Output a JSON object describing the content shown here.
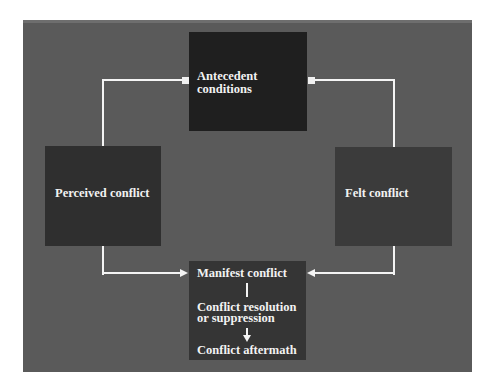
{
  "diagram": {
    "type": "conflict-process-cycle",
    "colors": {
      "panel": "#5a5a5a",
      "antecedent_box": "#1f1f1f",
      "perceived_box": "#2f2f2f",
      "felt_box": "#3b3b3b",
      "manifest_box": "#353535",
      "connector": "#f4f4f4",
      "text": "#f2f2f2"
    },
    "nodes": {
      "antecedent": {
        "line1": "Antecedent",
        "line2": "conditions"
      },
      "perceived": {
        "label": "Perceived conflict"
      },
      "felt": {
        "label": "Felt conflict"
      },
      "manifest": {
        "stage1": "Manifest conflict",
        "stage2_line1": "Conflict resolution",
        "stage2_line2": "or suppression",
        "stage3": "Conflict aftermath"
      }
    },
    "edges": [
      {
        "from": "antecedent",
        "to": "perceived"
      },
      {
        "from": "antecedent",
        "to": "felt"
      },
      {
        "from": "perceived",
        "to": "manifest"
      },
      {
        "from": "felt",
        "to": "manifest"
      },
      {
        "from": "manifest-conflict",
        "to": "conflict-resolution"
      },
      {
        "from": "conflict-resolution",
        "to": "conflict-aftermath"
      }
    ]
  }
}
